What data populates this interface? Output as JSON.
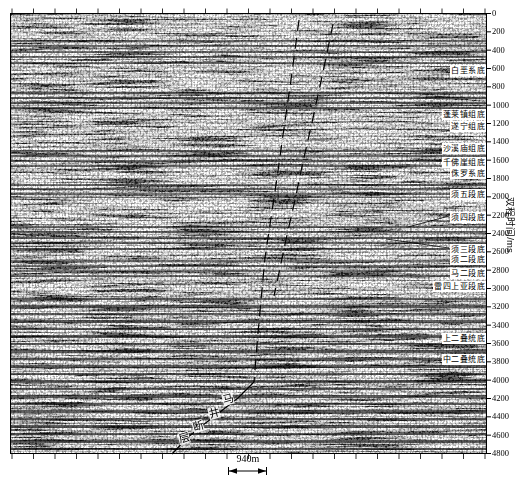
{
  "figure": {
    "axis": {
      "title": "双程时间/ms",
      "ticks": [
        0,
        200,
        400,
        600,
        800,
        1000,
        1200,
        1400,
        1600,
        1800,
        2000,
        2200,
        2400,
        2600,
        2800,
        3000,
        3200,
        3400,
        3600,
        3800,
        4000,
        4200,
        4400,
        4600,
        4800
      ]
    },
    "scale_bar": {
      "label": "940m"
    }
  },
  "chart_data": {
    "type": "heatmap",
    "title": "",
    "ylabel": "双程时间/ms",
    "ylim": [
      0,
      4800
    ],
    "y_tick_interval_ms": 200,
    "horizons": [
      {
        "name": "白垩系底",
        "time_ms": 620
      },
      {
        "name": "蓬莱镇组底",
        "time_ms": 1100
      },
      {
        "name": "遂宁组底",
        "time_ms": 1230
      },
      {
        "name": "沙溪庙组底",
        "time_ms": 1470
      },
      {
        "name": "千佛崖组底",
        "time_ms": 1630
      },
      {
        "name": "侏罗系底",
        "time_ms": 1740
      },
      {
        "name": "须五段底",
        "time_ms": 1970
      },
      {
        "name": "须四段底",
        "time_ms": 2220,
        "leader": [
          [
            408,
            227
          ],
          [
            449,
            216
          ]
        ]
      },
      {
        "name": "须三段底",
        "time_ms": 2570,
        "leader": [
          [
            386,
            239
          ],
          [
            449,
            248
          ]
        ]
      },
      {
        "name": "须二段底",
        "time_ms": 2680
      },
      {
        "name": "马二段底",
        "time_ms": 2840
      },
      {
        "name": "雷四上亚段底",
        "time_ms": 2980
      },
      {
        "name": "上二叠统底",
        "time_ms": 3550
      },
      {
        "name": "中二叠统底",
        "time_ms": 3770
      }
    ],
    "fault": {
      "name": "马井断层",
      "label_chars": [
        "马",
        "井",
        "断",
        "层"
      ],
      "char_positions_px": [
        [
          228,
          399
        ],
        [
          214,
          413
        ],
        [
          198,
          426
        ],
        [
          184,
          438
        ]
      ],
      "trace_px": [
        {
          "style": "dashed",
          "points": [
            [
              299,
              20
            ],
            [
              291,
              80
            ],
            [
              283,
              135
            ],
            [
              277,
              178
            ],
            [
              271,
              218
            ],
            [
              265,
              258
            ],
            [
              261,
              300
            ],
            [
              257,
              345
            ],
            [
              254,
              382
            ]
          ]
        },
        {
          "style": "dashed",
          "points": [
            [
              333,
              24
            ],
            [
              323,
              72
            ],
            [
              313,
              118
            ],
            [
              303,
              162
            ],
            [
              295,
              200
            ],
            [
              287,
              235
            ],
            [
              280,
              268
            ],
            [
              274,
              296
            ]
          ]
        },
        {
          "style": "solid",
          "points": [
            [
              254,
              382
            ],
            [
              238,
              398
            ],
            [
              220,
              412
            ],
            [
              203,
              425
            ],
            [
              187,
              438
            ],
            [
              172,
              454
            ]
          ]
        }
      ]
    },
    "scale_bar": {
      "label": "940m",
      "length_m": 940
    }
  }
}
